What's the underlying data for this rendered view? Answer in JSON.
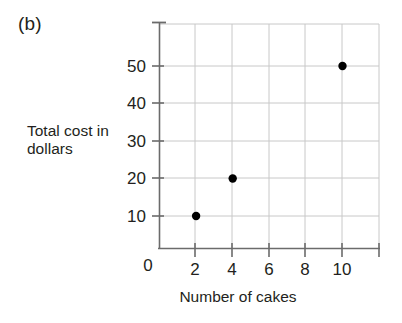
{
  "figure": {
    "panel_label": "(b)",
    "background": "#ffffff"
  },
  "chart_data": {
    "type": "scatter",
    "title": "",
    "xlabel": "Number of cakes",
    "ylabel": "Total cost in dollars",
    "ylabel_lines": [
      "Total cost in",
      "dollars"
    ],
    "x": [
      2,
      4,
      10
    ],
    "values": [
      10,
      20,
      50
    ],
    "points": [
      {
        "x": 2,
        "y": 10
      },
      {
        "x": 4,
        "y": 20
      },
      {
        "x": 10,
        "y": 50
      }
    ],
    "xlim": [
      0,
      12
    ],
    "ylim": [
      0,
      62
    ],
    "xticks": [
      0,
      2,
      4,
      6,
      8,
      10
    ],
    "xtick_labels": [
      "0",
      "2",
      "4",
      "6",
      "8",
      "10"
    ],
    "yticks": [
      10,
      20,
      30,
      40,
      50
    ],
    "ytick_labels": [
      "10",
      "20",
      "30",
      "40",
      "50"
    ],
    "grid": true,
    "legend": "none",
    "marker_color": "#000000",
    "grid_color": "#c8c8c8",
    "axis_color": "#6b6b6b",
    "text_color": "#231f20"
  }
}
